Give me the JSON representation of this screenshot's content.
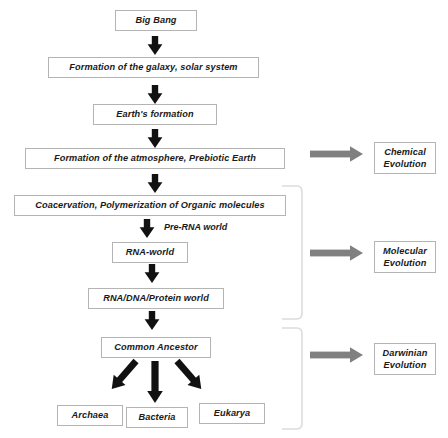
{
  "diagram": {
    "colors": {
      "box_border": "#b4b4b4",
      "box_fill": "#ffffff",
      "black_arrow": "#111111",
      "gray_arrow": "#808080",
      "bracket": "#d8d8d8",
      "text": "#1a1a1a"
    },
    "main_chain": [
      {
        "id": "big-bang",
        "label": "Big Bang"
      },
      {
        "id": "galaxy",
        "label": "Formation of the galaxy, solar system"
      },
      {
        "id": "earth",
        "label": "Earth's formation"
      },
      {
        "id": "atmosphere",
        "label": "Formation of the atmosphere, Prebiotic Earth"
      },
      {
        "id": "coacervation",
        "label": "Coacervation, Polymerization of Organic molecules"
      },
      {
        "id": "rna-world",
        "label": "RNA-world"
      },
      {
        "id": "rna-dna-protein",
        "label": "RNA/DNA/Protein world"
      },
      {
        "id": "common-ancestor",
        "label": "Common Ancestor"
      }
    ],
    "captions": [
      {
        "id": "pre-rna-world",
        "label": "Pre-RNA world"
      }
    ],
    "domains": [
      {
        "id": "archaea",
        "label": "Archaea"
      },
      {
        "id": "bacteria",
        "label": "Bacteria"
      },
      {
        "id": "eukarya",
        "label": "Eukarya"
      }
    ],
    "evolution_stages": [
      {
        "id": "chemical-evolution",
        "line1": "Chemical",
        "line2": "Evolution"
      },
      {
        "id": "molecular-evolution",
        "line1": "Molecular",
        "line2": "Evolution"
      },
      {
        "id": "darwinian-evolution",
        "line1": "Darwinian",
        "line2": "Evolution"
      }
    ]
  }
}
